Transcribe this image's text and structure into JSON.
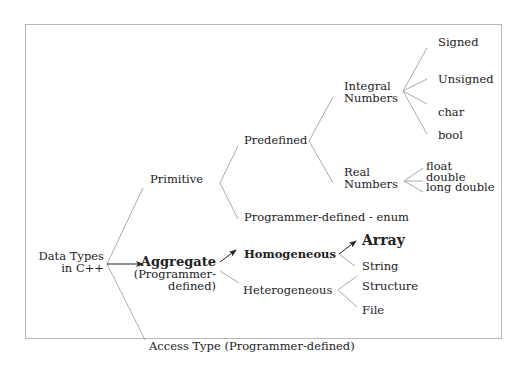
{
  "diagram": {
    "title": "Data Types in C++",
    "root": {
      "line1": "Data Types",
      "line2": "in C++"
    },
    "level1": {
      "primitive": "Primitive",
      "aggregate": {
        "line1": "Aggregate",
        "line2": "(Programmer-",
        "line3": "defined)"
      },
      "access": "Access Type (Programmer-defined)"
    },
    "primitive_children": {
      "predefined": "Predefined",
      "enum": "Programmer-defined - enum"
    },
    "predefined_children": {
      "integral": {
        "line1": "Integral",
        "line2": "Numbers"
      },
      "real": {
        "line1": "Real",
        "line2": "Numbers"
      }
    },
    "integral_children": [
      "Signed",
      "Unsigned",
      "char",
      "bool"
    ],
    "real_children": [
      "float",
      "double",
      "long double"
    ],
    "aggregate_children": {
      "homogeneous": "Homogeneous",
      "heterogeneous": "Heterogeneous"
    },
    "homogeneous_children": [
      "Array",
      "String"
    ],
    "heterogeneous_children": [
      "Structure",
      "File"
    ],
    "colors": {
      "line": "#aaaaaa",
      "arrow": "#222222",
      "text": "#222222",
      "frame": "#b8b8b8"
    }
  }
}
